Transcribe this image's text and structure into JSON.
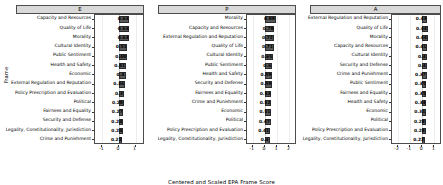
{
  "chart_data": {
    "type": "bar",
    "orientation": "horizontal",
    "title": "",
    "xlabel": "Centered and Scaled EPA Frame Score",
    "ylabel": "Frame",
    "grid": true,
    "legend": "none",
    "facets": [
      {
        "label": "E",
        "xlim": [
          -1.45,
          1.45
        ],
        "xticks": [
          -1,
          0,
          1
        ],
        "xticklabels": [
          "-1",
          "0",
          "1"
        ],
        "categories": [
          "Capacity and Resources",
          "Quality of Life",
          "Morality",
          "Cultural Identity",
          "Public Sentiment",
          "Health and Safety",
          "Economic",
          "External Regulation and Reputation",
          "Policy Prescription and Evaluation",
          "Political",
          "Fairness and Equality",
          "Security and Defense",
          "Legality, Constitutionality, Jurisdiction",
          "Crime and Punishment"
        ],
        "values": [
          0.63,
          0.63,
          0.63,
          0.51,
          0.48,
          0.41,
          0.4,
          0.36,
          0.3,
          0.28,
          0.27,
          0.24,
          0.24,
          0.21
        ],
        "value_labels": [
          "0.63",
          "0.63",
          "0.63",
          "0.51",
          "0.48",
          "0.41",
          "0.4",
          "0.36",
          "0.3",
          "0.28",
          "0.27",
          "0.24",
          "0.24",
          "0.21"
        ]
      },
      {
        "label": "P",
        "xlim": [
          -1.45,
          2.45
        ],
        "xticks": [
          -1,
          0,
          1,
          2
        ],
        "xticklabels": [
          "-1",
          "0",
          "1",
          "2"
        ],
        "categories": [
          "Morality",
          "Capacity and Resources",
          "External Regulation and Reputation",
          "Quality of Life",
          "Cultural Identity",
          "Public Sentiment",
          "Health and Safety",
          "Security and Defense",
          "Fairness and Equality",
          "Crime and Punishment",
          "Economic",
          "Political",
          "Policy Prescription and Evaluation",
          "Legality, Constitutionality, Jurisdiction"
        ],
        "values": [
          0.88,
          0.78,
          0.72,
          0.71,
          0.65,
          0.6,
          0.59,
          0.59,
          0.53,
          0.52,
          0.51,
          0.47,
          0.41,
          0.4
        ],
        "value_labels": [
          "0.88",
          "0.78",
          "0.72",
          "0.71",
          "0.65",
          "0.6",
          "0.59",
          "0.59",
          "0.53",
          "0.52",
          "0.51",
          "0.47",
          "0.41",
          "0.4"
        ]
      },
      {
        "label": "A",
        "xlim": [
          -2.45,
          1.45
        ],
        "xticks": [
          -2,
          -1,
          0,
          1
        ],
        "xticklabels": [
          "-2",
          "-1",
          "0",
          "1"
        ],
        "categories": [
          "External Regulation and Reputation",
          "Quality of Life",
          "Morality",
          "Capacity and Resources",
          "Cultural Identity",
          "Security and Defense",
          "Crime and Punishment",
          "Public Sentiment",
          "Fairness and Equality",
          "Health and Safety",
          "Economic",
          "Political",
          "Policy Prescription and Evaluation",
          "Legality, Constitutionality, Jurisdiction"
        ],
        "values": [
          0.43,
          0.44,
          0.44,
          0.41,
          0.4,
          0.4,
          0.37,
          0.35,
          0.35,
          0.34,
          0.31,
          0.28,
          0.28,
          0.22
        ],
        "value_labels": [
          "0.43",
          "0.44",
          "0.44",
          "0.41",
          "0.4",
          "0.4",
          "0.37",
          "0.35",
          "0.35",
          "0.34",
          "0.31",
          "0.28",
          "0.28",
          "0.22"
        ]
      }
    ]
  }
}
